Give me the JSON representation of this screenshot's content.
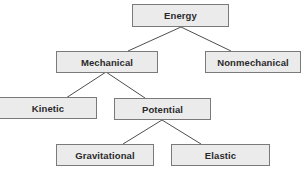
{
  "diagram": {
    "type": "hierarchy-tree",
    "colors": {
      "node_fill": "#ebebeb",
      "node_border": "#7a7a7a",
      "connector": "#3a3a3a",
      "text": "#2a2a2a"
    },
    "nodes": {
      "energy": {
        "label": "Energy"
      },
      "mechanical": {
        "label": "Mechanical"
      },
      "nonmechanical": {
        "label": "Nonmechanical"
      },
      "kinetic": {
        "label": "Kinetic"
      },
      "potential": {
        "label": "Potential"
      },
      "gravitational": {
        "label": "Gravitational"
      },
      "elastic": {
        "label": "Elastic"
      }
    },
    "edges": [
      {
        "from": "Energy",
        "to": "Mechanical"
      },
      {
        "from": "Energy",
        "to": "Nonmechanical"
      },
      {
        "from": "Mechanical",
        "to": "Kinetic"
      },
      {
        "from": "Mechanical",
        "to": "Potential"
      },
      {
        "from": "Potential",
        "to": "Gravitational"
      },
      {
        "from": "Potential",
        "to": "Elastic"
      }
    ]
  }
}
